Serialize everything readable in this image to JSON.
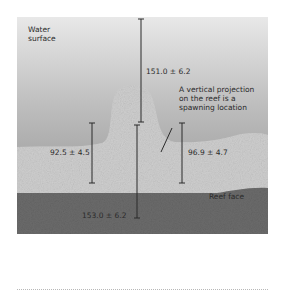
{
  "diagram": {
    "type": "reef cross-section",
    "labels": {
      "water_surface": [
        "Water",
        "surface"
      ],
      "annotation": [
        "A vertical projection",
        "on the reef is a",
        "spawning location"
      ],
      "reef_face": "Reef face"
    },
    "measurements": {
      "surface_to_peak": "151.0 ± 6.2",
      "left_projection_height": "92.5 ± 4.5",
      "right_projection_height": "96.9 ± 4.7",
      "peak_to_base": "153.0 ± 6.2"
    },
    "colors": {
      "water_top": "#e6e6e6",
      "water_bottom": "#7d7d7d",
      "reef": "#cfcfcf",
      "seabed": "#6e6e6e",
      "line": "#2a2a2a"
    }
  }
}
